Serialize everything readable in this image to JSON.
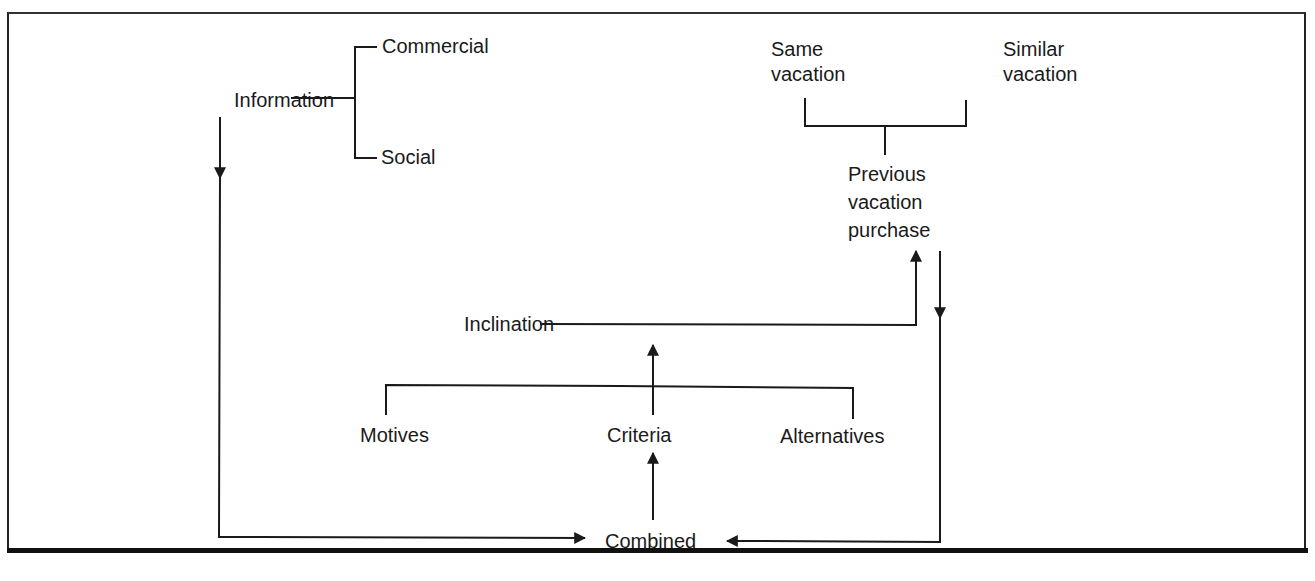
{
  "diagram": {
    "nodes": {
      "information": "Information",
      "commercial": "Commercial",
      "social": "Social",
      "same_vacation_line1": "Same",
      "same_vacation_line2": "vacation",
      "similar_vacation_line1": "Similar",
      "similar_vacation_line2": "vacation",
      "previous_line1": "Previous",
      "previous_line2": "vacation",
      "previous_line3": "purchase",
      "inclination": "Inclination",
      "motives": "Motives",
      "criteria": "Criteria",
      "alternatives": "Alternatives",
      "combined": "Combined"
    },
    "edges": [
      {
        "from": "Information",
        "to": "Commercial",
        "type": "branch"
      },
      {
        "from": "Information",
        "to": "Social",
        "type": "branch"
      },
      {
        "from": "Information",
        "to": "Combined",
        "type": "arrow"
      },
      {
        "from": "Same vacation",
        "to": "Previous vacation purchase",
        "type": "branch"
      },
      {
        "from": "Similar vacation",
        "to": "Previous vacation purchase",
        "type": "branch"
      },
      {
        "from": "Previous vacation purchase",
        "to": "Combined",
        "type": "arrow"
      },
      {
        "from": "Inclination",
        "to": "Previous vacation purchase",
        "type": "arrow"
      },
      {
        "from": "Criteria",
        "to": "Inclination",
        "type": "arrow"
      },
      {
        "from": "Motives",
        "to": "Inclination",
        "type": "branch"
      },
      {
        "from": "Alternatives",
        "to": "Inclination",
        "type": "branch"
      },
      {
        "from": "Combined",
        "to": "Criteria",
        "type": "arrow"
      }
    ],
    "line_color": "#1a1a1a"
  }
}
